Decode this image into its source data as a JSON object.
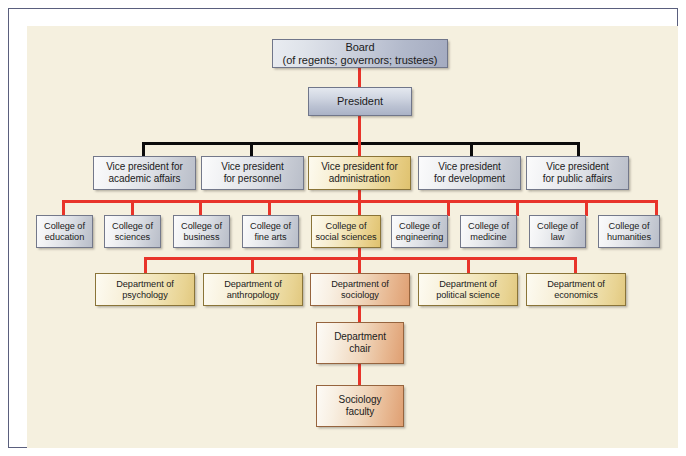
{
  "chart": {
    "background_color": "#f5f0df",
    "frame_color": "#5a5f7d",
    "connector_colors": {
      "primary": "#e8342a",
      "secondary": "#0b0b0b"
    },
    "levels": [
      {
        "level_name": "board",
        "nodes": [
          {
            "id": "board",
            "label": "Board\n(of regents; governors; trustees)",
            "style": "steel",
            "highlighted": false
          }
        ]
      },
      {
        "level_name": "president",
        "nodes": [
          {
            "id": "president",
            "label": "President",
            "style": "steel-h",
            "highlighted": false
          }
        ]
      },
      {
        "level_name": "vice-presidents",
        "nodes": [
          {
            "id": "vp-academic",
            "label": "Vice president for\nacademic affairs",
            "style": "silver",
            "highlighted": false
          },
          {
            "id": "vp-personnel",
            "label": "Vice president\nfor personnel",
            "style": "silver",
            "highlighted": false
          },
          {
            "id": "vp-administration",
            "label": "Vice president for\nadministration",
            "style": "gold",
            "highlighted": true
          },
          {
            "id": "vp-development",
            "label": "Vice president\nfor development",
            "style": "silver",
            "highlighted": false
          },
          {
            "id": "vp-public-affairs",
            "label": "Vice president\nfor public affairs",
            "style": "silver",
            "highlighted": false
          }
        ]
      },
      {
        "level_name": "colleges",
        "nodes": [
          {
            "id": "college-education",
            "label": "College of\neducation",
            "style": "silver",
            "highlighted": false
          },
          {
            "id": "college-sciences",
            "label": "College of\nsciences",
            "style": "silver",
            "highlighted": false
          },
          {
            "id": "college-business",
            "label": "College of\nbusiness",
            "style": "silver",
            "highlighted": false
          },
          {
            "id": "college-fine-arts",
            "label": "College of\nfine arts",
            "style": "silver",
            "highlighted": false
          },
          {
            "id": "college-social-sciences",
            "label": "College of\nsocial sciences",
            "style": "gold",
            "highlighted": true
          },
          {
            "id": "college-engineering",
            "label": "College of\nengineering",
            "style": "silver",
            "highlighted": false
          },
          {
            "id": "college-medicine",
            "label": "College of\nmedicine",
            "style": "silver",
            "highlighted": false
          },
          {
            "id": "college-law",
            "label": "College of\nlaw",
            "style": "silver",
            "highlighted": false
          },
          {
            "id": "college-humanities",
            "label": "College of\nhumanities",
            "style": "silver",
            "highlighted": false
          }
        ]
      },
      {
        "level_name": "departments",
        "nodes": [
          {
            "id": "dept-psychology",
            "label": "Department of\npsychology",
            "style": "tan",
            "highlighted": false
          },
          {
            "id": "dept-anthropology",
            "label": "Department of\nanthropology",
            "style": "tan",
            "highlighted": false
          },
          {
            "id": "dept-sociology",
            "label": "Department of\nsociology",
            "style": "orange",
            "highlighted": true
          },
          {
            "id": "dept-political-science",
            "label": "Department of\npolitical science",
            "style": "tan",
            "highlighted": false
          },
          {
            "id": "dept-economics",
            "label": "Department of\neconomics",
            "style": "tan",
            "highlighted": false
          }
        ]
      },
      {
        "level_name": "department-chair",
        "nodes": [
          {
            "id": "department-chair",
            "label": "Department\nchair",
            "style": "orange",
            "highlighted": true
          }
        ]
      },
      {
        "level_name": "faculty",
        "nodes": [
          {
            "id": "sociology-faculty",
            "label": "Sociology\nfaculty",
            "style": "orange",
            "highlighted": true
          }
        ]
      }
    ]
  }
}
